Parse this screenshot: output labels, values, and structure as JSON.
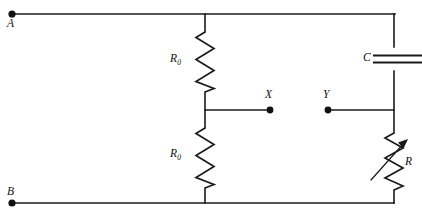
{
  "diagram": {
    "background_color": "#ffffff",
    "line_color": "#1a1a1a",
    "terminals": [
      {
        "id": "A",
        "label": "A",
        "x": 12,
        "y": 14,
        "label_x": 10,
        "label_y": 18
      },
      {
        "id": "B",
        "label": "B",
        "x": 12,
        "y": 203,
        "label_x": 10,
        "label_y": 186
      },
      {
        "id": "X",
        "label": "X",
        "x": 270,
        "y": 110,
        "label_x": 265,
        "label_y": 91
      },
      {
        "id": "Y",
        "label": "Y",
        "x": 328,
        "y": 110,
        "label_x": 323,
        "label_y": 91
      }
    ],
    "components": [
      {
        "id": "R0-top",
        "type": "resistor",
        "label": "R",
        "subscript": "0",
        "label_x": 170,
        "label_y": 52,
        "orientation": "vertical",
        "x": 205,
        "y_start": 32,
        "y_end": 92
      },
      {
        "id": "R0-bottom",
        "type": "resistor",
        "label": "R",
        "subscript": "0",
        "label_x": 170,
        "label_y": 146,
        "orientation": "vertical",
        "x": 205,
        "y_start": 128,
        "y_end": 188
      },
      {
        "id": "C",
        "type": "capacitor",
        "label": "C",
        "subscript": "",
        "label_x": 363,
        "label_y": 52,
        "orientation": "horizontal-plates",
        "x": 393,
        "y": 59
      },
      {
        "id": "R",
        "type": "variable-resistor",
        "label": "R",
        "subscript": "",
        "label_x": 404,
        "label_y": 155,
        "orientation": "vertical",
        "x": 393,
        "y_start": 133,
        "y_end": 190
      }
    ],
    "notes": {
      "top_rail": "A to top-right corner",
      "bottom_rail": "B to bottom-right corner",
      "divider_node": "midpoint between the two R0 resistors connects to X",
      "y_branch": "Y connects to the right vertical branch containing C and R"
    }
  }
}
